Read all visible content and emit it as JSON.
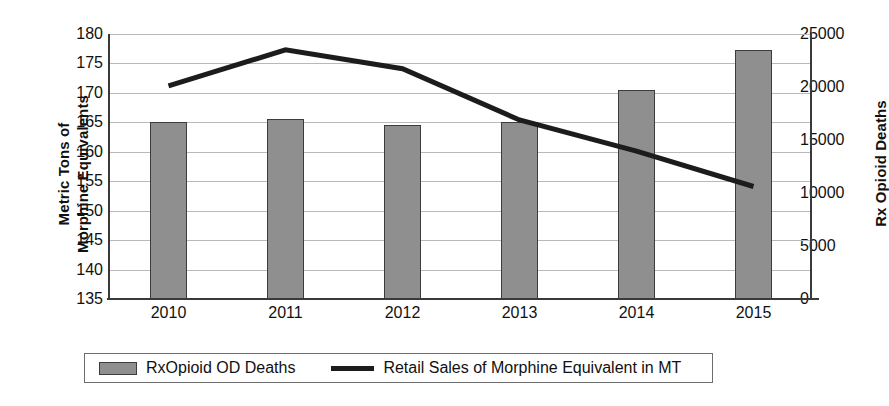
{
  "chart_data": {
    "type": "bar",
    "title": "",
    "subtitle": "",
    "xlabel": "",
    "categories": [
      "2010",
      "2011",
      "2012",
      "2013",
      "2014",
      "2015"
    ],
    "grid": true,
    "legend_position": "bottom",
    "axes": {
      "left": {
        "label_line1": "Metric Tons of",
        "label_line2": "Morphine Equivalents",
        "ylim": [
          135,
          180
        ],
        "tick_step": 5,
        "ticks": [
          "180",
          "175",
          "170",
          "165",
          "160",
          "155",
          "150",
          "145",
          "140",
          "135"
        ],
        "tick_values": [
          180,
          175,
          170,
          165,
          160,
          155,
          150,
          145,
          140,
          135
        ]
      },
      "right": {
        "label": "Rx Opioid Deaths",
        "ylim": [
          0,
          25000
        ],
        "tick_step": 5000,
        "ticks": [
          "25000",
          "20000",
          "15000",
          "10000",
          "5000",
          "0"
        ],
        "tick_values": [
          25000,
          20000,
          15000,
          10000,
          5000,
          0
        ]
      }
    },
    "series": [
      {
        "name": "RxOpioid OD Deaths",
        "type": "bar",
        "axis": "right",
        "color": "#8f8f8f",
        "edge_color": "#3c3c3c",
        "values": [
          16700,
          17000,
          16400,
          16700,
          19700,
          23500
        ]
      },
      {
        "name": "Retail Sales of Morphine Equivalent in MT",
        "type": "line",
        "axis": "left",
        "color": "#1c1c1c",
        "values": [
          171.2,
          177.3,
          174.1,
          165.4,
          160.1,
          154.1
        ]
      }
    ]
  },
  "legend": {
    "items": [
      {
        "label": "RxOpioid OD Deaths",
        "marker": "bar-swatch"
      },
      {
        "label": "Retail Sales of Morphine Equivalent in MT",
        "marker": "line-swatch"
      }
    ]
  }
}
